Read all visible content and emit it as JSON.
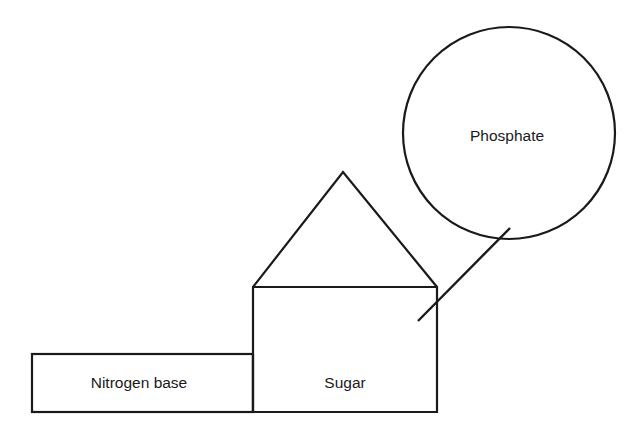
{
  "diagram": {
    "background_color": "#ffffff",
    "stroke_color": "#1a1a1a",
    "text_color": "#1a1a1a",
    "shapes": {
      "nitrogen_base": {
        "label": "Nitrogen base",
        "shape": "rectangle",
        "x": 32,
        "y": 354,
        "width": 221,
        "height": 58,
        "label_x": 139,
        "label_y": 384
      },
      "sugar": {
        "label": "Sugar",
        "shape": "pentagon",
        "rect_x": 253,
        "rect_y": 287,
        "rect_width": 184,
        "rect_height": 125,
        "apex_x": 343,
        "apex_y": 172,
        "label_x": 345,
        "label_y": 384
      },
      "phosphate": {
        "label": "Phosphate",
        "shape": "circle",
        "center_x": 509,
        "center_y": 133,
        "radius": 106,
        "label_x": 507,
        "label_y": 137
      }
    },
    "connector": {
      "name": "phosphate-sugar-bond",
      "x1": 418,
      "y1": 321,
      "x2": 510,
      "y2": 228
    }
  }
}
